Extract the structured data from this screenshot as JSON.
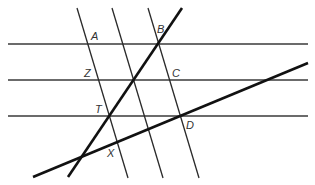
{
  "diagram": {
    "type": "geometry",
    "labels": {
      "A": "A",
      "B": "B",
      "Z": "Z",
      "C": "C",
      "T": "T",
      "D": "D",
      "X": "X"
    },
    "colors": {
      "line": "#2a2a2a",
      "thick_line": "#111111",
      "label": "#333333",
      "background": "#ffffff"
    }
  }
}
